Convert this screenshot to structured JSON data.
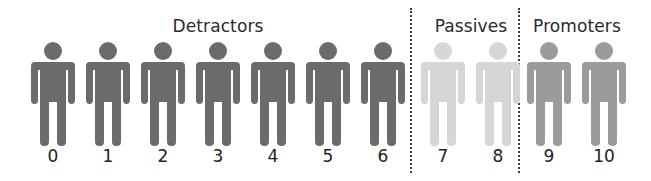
{
  "chart_data": {
    "type": "diagram",
    "groups": [
      {
        "name": "Detractors",
        "scores": [
          0,
          1,
          2,
          3,
          4,
          5,
          6
        ],
        "color": "#6b6b6b"
      },
      {
        "name": "Passives",
        "scores": [
          7,
          8
        ],
        "color": "#d6d6d6"
      },
      {
        "name": "Promoters",
        "scores": [
          9,
          10
        ],
        "color": "#9b9b9b"
      }
    ]
  },
  "labels": {
    "detractors": "Detractors",
    "passives": "Passives",
    "promoters": "Promoters"
  },
  "scores": [
    "0",
    "1",
    "2",
    "3",
    "4",
    "5",
    "6",
    "7",
    "8",
    "9",
    "10"
  ],
  "colors": {
    "detractor": "#6b6b6b",
    "passive": "#d6d6d6",
    "promoter": "#9b9b9b",
    "divider": "#3a3a3a"
  }
}
